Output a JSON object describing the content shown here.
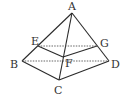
{
  "diagram": {
    "type": "pyramid-cross-section",
    "points": {
      "A": {
        "x": 72,
        "y": 13,
        "lx": 68,
        "ly": 10
      },
      "B": {
        "x": 22,
        "y": 61,
        "lx": 10,
        "ly": 68
      },
      "C": {
        "x": 59,
        "y": 80,
        "lx": 54,
        "ly": 94
      },
      "D": {
        "x": 109,
        "y": 61,
        "lx": 111,
        "ly": 68
      },
      "E": {
        "x": 38,
        "y": 46,
        "lx": 31,
        "ly": 45
      },
      "F": {
        "x": 63,
        "y": 57,
        "lx": 65,
        "ly": 67
      },
      "G": {
        "x": 97,
        "y": 46,
        "lx": 100,
        "ly": 47
      }
    },
    "labels": [
      "A",
      "B",
      "C",
      "D",
      "E",
      "F",
      "G"
    ],
    "solid_edges": [
      [
        "A",
        "B"
      ],
      [
        "A",
        "C"
      ],
      [
        "A",
        "D"
      ],
      [
        "B",
        "C"
      ],
      [
        "C",
        "D"
      ],
      [
        "E",
        "F"
      ],
      [
        "F",
        "G"
      ]
    ],
    "dashed_edges": [
      [
        "E",
        "G"
      ],
      [
        "B",
        "D"
      ]
    ],
    "colors": {
      "line": "#2a2a2a",
      "dashed": "#555555",
      "label": "#333333"
    }
  }
}
